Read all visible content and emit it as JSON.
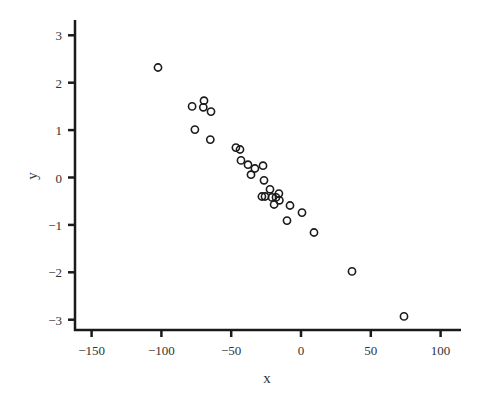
{
  "chart_data": {
    "type": "scatter",
    "title": "",
    "xlabel": "x",
    "ylabel": "y",
    "xlim": [
      -163,
      115
    ],
    "ylim": [
      -3.3,
      3.35
    ],
    "xticks": [
      -150,
      -100,
      -50,
      0,
      50,
      100
    ],
    "yticks": [
      -3,
      -2,
      -1,
      0,
      1,
      2,
      3
    ],
    "grid": false,
    "legend": null,
    "marker": "open-circle",
    "marker_color": "#1a1a1a",
    "series": [
      {
        "name": "points",
        "x": [
          -102.4,
          -78,
          -69.5,
          -70,
          -64.5,
          -76,
          -65,
          -46.6,
          -43.7,
          -43,
          -38,
          -33,
          -27.2,
          -35.8,
          -26.5,
          -22.2,
          -28,
          -25.8,
          -20.8,
          -15.8,
          -17.9,
          -19.3,
          -15.5,
          -7.9,
          0.7,
          -10,
          9.3,
          36.5,
          73.8
        ],
        "y": [
          2.32,
          1.5,
          1.62,
          1.48,
          1.39,
          1.01,
          0.8,
          0.63,
          0.59,
          0.36,
          0.27,
          0.19,
          0.25,
          0.06,
          -0.06,
          -0.25,
          -0.4,
          -0.4,
          -0.42,
          -0.34,
          -0.42,
          -0.57,
          -0.48,
          -0.59,
          -0.74,
          -0.91,
          -1.16,
          -1.98,
          -2.93
        ]
      }
    ]
  }
}
